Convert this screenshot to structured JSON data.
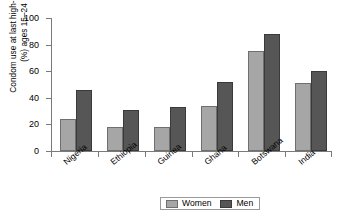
{
  "chart_data": {
    "type": "bar",
    "title": "",
    "subtitle": "",
    "xlabel": "",
    "ylabel_line1": "Condom use at last high-risk sex",
    "ylabel_line2": "(%) ages 15–24",
    "categories": [
      "Nigeria",
      "Ethiopia",
      "Guinea",
      "Ghana",
      "Botswana",
      "India"
    ],
    "series": [
      {
        "name": "Women",
        "color": "#a6a6a6",
        "values": [
          24,
          18,
          18,
          34,
          75,
          51
        ]
      },
      {
        "name": "Men",
        "color": "#565656",
        "values": [
          46,
          31,
          33,
          52,
          88,
          60
        ]
      }
    ],
    "ylim": [
      0,
      100
    ],
    "yticks": [
      0,
      20,
      40,
      60,
      80,
      100
    ],
    "ytick_labels": [
      "0",
      "20",
      "40",
      "60",
      "80",
      "100"
    ],
    "grid": false,
    "legend_position": "bottom-center",
    "legend_entries": [
      "Women",
      "Men"
    ]
  },
  "legend": {
    "women_label": "Women",
    "men_label": "Men"
  }
}
